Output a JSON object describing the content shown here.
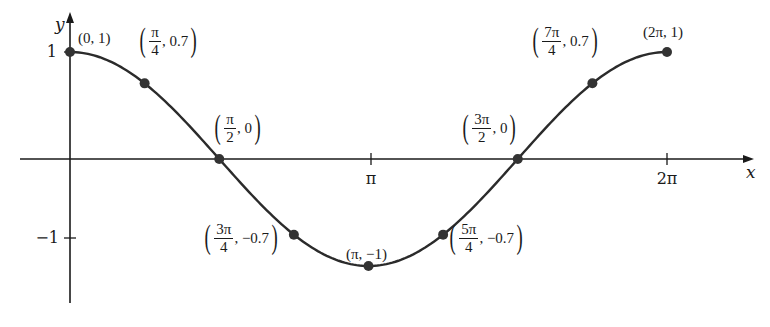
{
  "chart_data": {
    "type": "line",
    "title": "",
    "function": "y = cos(x)",
    "xlabel": "x",
    "ylabel": "y",
    "xlim": [
      0,
      6.2832
    ],
    "ylim": [
      -1,
      1
    ],
    "x_ticks": [
      {
        "value": 3.1416,
        "label": "π"
      },
      {
        "value": 6.2832,
        "label": "2π"
      }
    ],
    "y_ticks": [
      {
        "value": 1,
        "label": "1"
      },
      {
        "value": -1,
        "label": "−1"
      }
    ],
    "grid": false,
    "legend": null,
    "points": [
      {
        "x": 0,
        "y": 1,
        "label": "(0, 1)"
      },
      {
        "x": 0.7854,
        "y": 0.7,
        "label": "(π/4, 0.7)"
      },
      {
        "x": 1.5708,
        "y": 0,
        "label": "(π/2, 0)"
      },
      {
        "x": 2.3562,
        "y": -0.7,
        "label": "(3π/4, −0.7)"
      },
      {
        "x": 3.1416,
        "y": -1,
        "label": "(π, −1)"
      },
      {
        "x": 3.927,
        "y": -0.7,
        "label": "(5π/4, −0.7)"
      },
      {
        "x": 4.7124,
        "y": 0,
        "label": "(3π/2, 0)"
      },
      {
        "x": 5.4978,
        "y": 0.7,
        "label": "(7π/4, 0.7)"
      },
      {
        "x": 6.2832,
        "y": 1,
        "label": "(2π, 1)"
      }
    ]
  },
  "axes": {
    "x_label": "x",
    "y_label": "y",
    "tick_pi": "π",
    "tick_2pi": "2π",
    "tick_1": "1",
    "tick_neg1": "−1"
  },
  "labels": {
    "p0": "(0, 1)",
    "p1": {
      "num": "π",
      "den": "4",
      "rest": ", 0.7"
    },
    "p2": {
      "num": "π",
      "den": "2",
      "rest": ", 0"
    },
    "p3": {
      "num": "3π",
      "den": "4",
      "rest": ", −0.7"
    },
    "p4": "(π, −1)",
    "p5": {
      "num": "5π",
      "den": "4",
      "rest": ", −0.7"
    },
    "p6": {
      "num": "3π",
      "den": "2",
      "rest": ", 0"
    },
    "p7": {
      "num": "7π",
      "den": "4",
      "rest": ", 0.7"
    },
    "p8": "(2π, 1)"
  },
  "colors": {
    "curve": "#2b2b2b",
    "axis": "#1a1a1a",
    "point": "#333333",
    "background": "#ffffff"
  }
}
